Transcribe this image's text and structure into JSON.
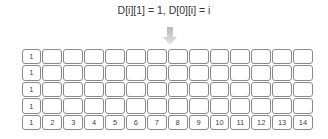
{
  "title": "D[i][1] = 1, D[0][i] = i",
  "arrow_icon": "down-arrow-icon",
  "grid": {
    "rows": 5,
    "cols": 14,
    "cells": [
      [
        "1",
        "",
        "",
        "",
        "",
        "",
        "",
        "",
        "",
        "",
        "",
        "",
        "",
        ""
      ],
      [
        "1",
        "",
        "",
        "",
        "",
        "",
        "",
        "",
        "",
        "",
        "",
        "",
        "",
        ""
      ],
      [
        "1",
        "",
        "",
        "",
        "",
        "",
        "",
        "",
        "",
        "",
        "",
        "",
        "",
        ""
      ],
      [
        "1",
        "",
        "",
        "",
        "",
        "",
        "",
        "",
        "",
        "",
        "",
        "",
        "",
        ""
      ],
      [
        "1",
        "2",
        "3",
        "4",
        "5",
        "6",
        "7",
        "8",
        "9",
        "10",
        "11",
        "12",
        "13",
        "14"
      ]
    ]
  }
}
